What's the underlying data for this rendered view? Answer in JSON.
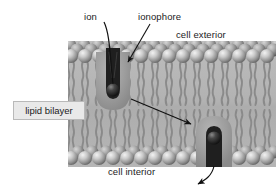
{
  "figure": {
    "type": "cell-membrane-diagram"
  },
  "labels": {
    "ion": "ion",
    "ionophore": "ionophore",
    "cell_exterior": "cell exterior",
    "cell_interior": "cell interior",
    "lipid_bilayer": "lipid bilayer"
  },
  "colors": {
    "background": "#ffffff",
    "text": "#1b1b1b",
    "membrane_body": "#b3b3b3",
    "head_light": "#e4e4e4",
    "head_mid": "#a8a8a8",
    "head_dark": "#6f6f6f",
    "tail": "#8d8d8d",
    "ionophore_blob": "#9a9a9a",
    "ionophore_channel": "#1e1e1e",
    "ion_sphere": "#2a2a2a",
    "leader_line": "#111111",
    "label_box_fill": "#e9e9e9",
    "label_box_border": "#b9b9b9"
  },
  "geometry": {
    "membrane": {
      "x": 68,
      "y": 41,
      "width": 208,
      "height": 126
    },
    "outer_leaflet_head_row_y": 52,
    "inner_leaflet_head_row_y": 156,
    "head_radius": 7,
    "heads_per_row": 15,
    "upper_ionophore": {
      "cx": 113,
      "cy": 78,
      "ion_cx": 113,
      "ion_cy": 92
    },
    "lower_ionophore": {
      "cx": 214,
      "cy": 140,
      "ion_cx": 214,
      "ion_cy": 140
    }
  },
  "annotations": [
    {
      "name": "ion-leader",
      "from_label": "ion",
      "to": "upper-ion-sphere",
      "style": "curved-line"
    },
    {
      "name": "ionophore-leader",
      "from_label": "ionophore",
      "to": "upper-ionophore-channel",
      "style": "straight-arrow"
    },
    {
      "name": "transport-arrow",
      "from": "upper-ionophore-blob",
      "to": "lower-ionophore-blob",
      "style": "straight-arrow"
    },
    {
      "name": "release-arrow",
      "from": "lower-ionophore-channel",
      "to": "cell-interior",
      "style": "curved-arrow"
    }
  ]
}
